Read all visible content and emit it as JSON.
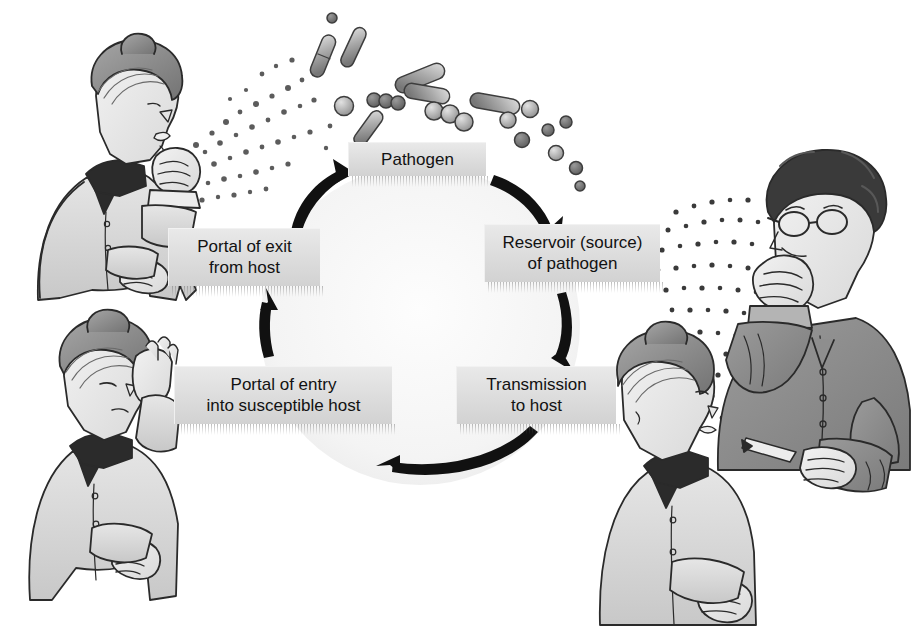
{
  "figure": {
    "type": "cycle-diagram",
    "background_color": "#ffffff",
    "ink_color": "#111111"
  },
  "cycle": {
    "direction": "clockwise",
    "center": {
      "x": 420,
      "y": 325
    },
    "radius": 150,
    "nodes": [
      {
        "id": "pathogen",
        "label": "Pathogen",
        "position": "top"
      },
      {
        "id": "reservoir",
        "label": "Reservoir (source)\nof pathogen",
        "line1": "Reservoir (source)",
        "line2": "of pathogen",
        "position": "right-upper"
      },
      {
        "id": "transmission",
        "label": "Transmission\nto host",
        "line1": "Transmission",
        "line2": "to host",
        "position": "right-lower"
      },
      {
        "id": "entry",
        "label": "Portal of entry\ninto susceptible host",
        "line1": "Portal of entry",
        "line2": "into susceptible host",
        "position": "left-lower"
      },
      {
        "id": "exit",
        "label": "Portal of exit\nfrom host",
        "line1": "Portal of exit",
        "line2": "from host",
        "position": "left-upper"
      }
    ],
    "arrows": [
      {
        "from": "exit",
        "to": "pathogen",
        "direction": "up-right"
      },
      {
        "from": "pathogen",
        "to": "reservoir",
        "direction": "down-right"
      },
      {
        "from": "reservoir",
        "to": "transmission",
        "direction": "down"
      },
      {
        "from": "transmission",
        "to": "entry",
        "direction": "left"
      },
      {
        "from": "entry",
        "to": "exit",
        "direction": "up"
      }
    ],
    "box_fill": "#dcdcdc",
    "box_text_color": "#121212"
  },
  "illustrations": [
    {
      "id": "person-coughing-left",
      "caption_role": "Portal of exit from host",
      "description": "Woman coughing into fist, droplets spraying to the right",
      "facing": "right",
      "hair_color": "#8d8d8d",
      "garment_color": "#dcdcdc",
      "collar_color": "#2b2b2b"
    },
    {
      "id": "person-rubbing-eye",
      "caption_role": "Portal of entry into susceptible host",
      "description": "Woman rubbing her eye with her hand",
      "facing": "right-down",
      "hair_color": "#8d8d8d",
      "garment_color": "#dcdcdc",
      "collar_color": "#2b2b2b"
    },
    {
      "id": "person-coughing-right",
      "caption_role": "Reservoir (source) of pathogen",
      "description": "Man with glasses coughing into fist, droplets spraying to the left",
      "facing": "left",
      "hair_color": "#3a3a3a",
      "garment_color": "#8e8e8e",
      "accessory": "eyeglasses"
    },
    {
      "id": "person-receiving",
      "caption_role": "Transmission to host",
      "description": "Woman facing right receiving airborne droplets",
      "facing": "right",
      "hair_color": "#8d8d8d",
      "garment_color": "#dcdcdc",
      "collar_color": "#2b2b2b"
    }
  ],
  "microbes": {
    "label": "Pathogen cluster above the cycle",
    "kinds": [
      "bacillus-rod",
      "coccus-sphere",
      "diplococcus-chain"
    ],
    "count_rods": 7,
    "count_spheres": 16,
    "fill_light": "#c9c9c9",
    "fill_dark": "#7e7e7e",
    "outline": "#3d3d3d"
  },
  "droplet_sprays": [
    {
      "id": "spray-from-left-person",
      "origin": "mouth of coughing woman (left)",
      "direction": "right-up",
      "dot_count": 54,
      "dot_color": "#5c5c5c"
    },
    {
      "id": "spray-from-right-person",
      "origin": "mouth of coughing man (right)",
      "direction": "left-down",
      "dot_count": 62,
      "dot_color": "#3a3a3a"
    }
  ]
}
